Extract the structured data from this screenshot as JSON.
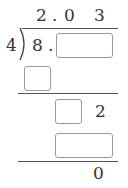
{
  "problem": {
    "quotient": {
      "d1": "2",
      "dot": ".",
      "d2": "0",
      "d3": "3"
    },
    "divisor": "4",
    "dividend": {
      "whole": "8",
      "dot": "."
    },
    "step2": {
      "digit": "2"
    },
    "remainder": "0"
  },
  "blanks": [
    {
      "id": "dividend-decimal-blank",
      "value": ""
    },
    {
      "id": "first-product-blank",
      "value": ""
    },
    {
      "id": "second-difference-blank",
      "value": ""
    },
    {
      "id": "third-product-blank",
      "value": ""
    }
  ],
  "colors": {
    "text": "#333333",
    "line": "#555555",
    "box_border": "#9a9a9a"
  }
}
